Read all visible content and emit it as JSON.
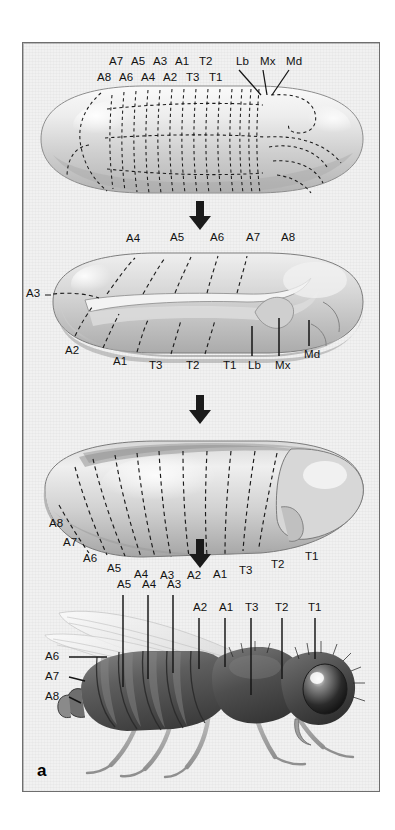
{
  "figure": {
    "panel_letter": "a",
    "title_caption": "",
    "background_color": "#f1f1f1",
    "border_color": "#6e6e6e"
  },
  "stages": [
    {
      "id": "blastoderm-fate-map",
      "name": "cellular blastoderm fate map",
      "top_labels_row1": [
        "A7",
        "A5",
        "A3",
        "A1",
        "T2"
      ],
      "top_labels_row2": [
        "A8",
        "A6",
        "A4",
        "A2",
        "T3",
        "T1"
      ],
      "head_labels": [
        "Lb",
        "Mx",
        "Md"
      ]
    },
    {
      "id": "germ-band-extended",
      "name": "extended germ band",
      "dorsal_labels": [
        "A4",
        "A5",
        "A6",
        "A7",
        "A8"
      ],
      "anterior_label": "A3",
      "ventral_labels": [
        "A2",
        "A1",
        "T3",
        "T2",
        "T1"
      ],
      "head_labels": [
        "Lb",
        "Mx",
        "Md"
      ]
    },
    {
      "id": "germ-band-retracted",
      "name": "retracted germ band / larva",
      "labels": [
        "A8",
        "A7",
        "A6",
        "A5",
        "A4",
        "A3",
        "A2",
        "A1",
        "T3",
        "T2",
        "T1"
      ]
    },
    {
      "id": "adult-fly",
      "name": "adult fly",
      "top_labels": [
        "A5",
        "A4",
        "A3",
        "A2",
        "A1",
        "T3",
        "T2",
        "T1"
      ],
      "left_labels": [
        "A6",
        "A7",
        "A8"
      ]
    }
  ],
  "arrows": {
    "glyph": "↓",
    "count": 3,
    "color": "#1a1a1a"
  },
  "colors": {
    "ink": "#111111",
    "embryo_light": "#f4f4f4",
    "embryo_mid": "#c9c9c9",
    "embryo_dark": "#9a9a9a",
    "fly_dark": "#5c5c5c",
    "fly_darker": "#3a3a3a",
    "wing": "#e9e9e9"
  }
}
